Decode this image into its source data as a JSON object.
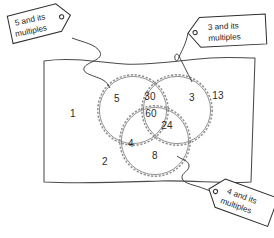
{
  "diagram": {
    "universe": {
      "name": "universal-set-rectangle",
      "stroke_color": "#4a4a4a"
    },
    "circles": [
      {
        "id": "multiples-of-5",
        "cx": 133,
        "cy": 110,
        "r": 34,
        "stroke_color": "#8f8f8f"
      },
      {
        "id": "multiples-of-3",
        "cx": 177,
        "cy": 110,
        "r": 34,
        "stroke_color": "#8f8f8f"
      },
      {
        "id": "multiples-of-4",
        "cx": 155,
        "cy": 141,
        "r": 34,
        "stroke_color": "#8f8f8f"
      }
    ],
    "tags": [
      {
        "id": "tag-5",
        "line1": "5 and its",
        "line2": "multiples",
        "position": "top-left",
        "rotation": -12
      },
      {
        "id": "tag-3",
        "line1": "3 and its",
        "line2": "multiples",
        "position": "top-right",
        "rotation": -3
      },
      {
        "id": "tag-4",
        "line1": "4 and its",
        "line2": "multiples",
        "position": "bottom-right",
        "rotation": 20
      }
    ],
    "numbers": [
      {
        "id": "number-1",
        "value": "1",
        "x": 73,
        "y": 113,
        "region": "outside-all"
      },
      {
        "id": "number-13",
        "value": "13",
        "x": 218,
        "y": 95,
        "region": "outside-all"
      },
      {
        "id": "number-2",
        "value": "2",
        "x": 105,
        "y": 161,
        "region": "outside-all"
      },
      {
        "id": "number-5",
        "value": "5",
        "x": 117,
        "y": 98,
        "region": "only-5"
      },
      {
        "id": "number-3",
        "value": "3",
        "x": 192,
        "y": 97,
        "region": "only-3"
      },
      {
        "id": "number-8",
        "value": "8",
        "x": 155,
        "y": 155,
        "region": "only-4"
      },
      {
        "id": "number-30",
        "value": "30",
        "x": 150,
        "y": 96,
        "region": "5-and-3"
      },
      {
        "id": "number-4",
        "value": "4",
        "x": 131,
        "y": 143,
        "region": "5-and-4"
      },
      {
        "id": "number-24",
        "value": "24",
        "x": 167,
        "y": 125,
        "region": "3-and-4"
      },
      {
        "id": "number-60",
        "value": "60",
        "x": 151,
        "y": 113,
        "region": "5-and-3-and-4"
      }
    ]
  }
}
